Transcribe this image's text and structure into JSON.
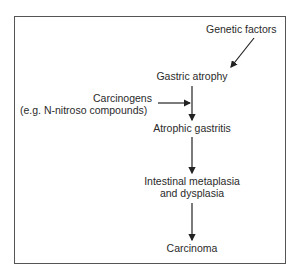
{
  "diagram": {
    "nodes": {
      "genetic_factors": "Genetic factors",
      "gastric_atrophy": "Gastric atrophy",
      "carcinogens": "Carcinogens",
      "carcinogens_example": "(e.g. N-nitroso compounds)",
      "atrophic_gastritis": "Atrophic gastritis",
      "intestinal_line1": "Intestinal metaplasia",
      "intestinal_line2": "and dysplasia",
      "carcinoma": "Carcinoma"
    },
    "edges": [
      {
        "from": "Genetic factors",
        "to": "Gastric atrophy"
      },
      {
        "from": "Gastric atrophy",
        "to": "Atrophic gastritis"
      },
      {
        "from": "Carcinogens",
        "to": "Gastric atrophy -> Atrophic gastritis arrow"
      },
      {
        "from": "Atrophic gastritis",
        "to": "Intestinal metaplasia and dysplasia"
      },
      {
        "from": "Intestinal metaplasia and dysplasia",
        "to": "Carcinoma"
      }
    ]
  }
}
